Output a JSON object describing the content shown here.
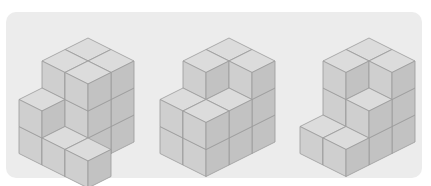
{
  "colors": {
    "background": "#ffffff",
    "panel": "#ececec",
    "top_face": "#dcdcdc",
    "left_face": "#cfcfcf",
    "right_face": "#c2c2c2",
    "edge": "#9a9a9a"
  },
  "projection": {
    "a": 23,
    "b": 11.5,
    "h": 27
  },
  "figures": [
    {
      "name": "figure-1",
      "origin": [
        88,
        38
      ],
      "heights": [
        [
          3,
          3,
          0
        ],
        [
          3,
          3,
          0
        ],
        [
          2,
          1,
          1
        ]
      ]
    },
    {
      "name": "figure-2",
      "origin": [
        229,
        38
      ],
      "heights": [
        [
          3,
          3,
          0
        ],
        [
          3,
          2,
          0
        ],
        [
          2,
          2,
          0
        ]
      ]
    },
    {
      "name": "figure-3",
      "origin": [
        369,
        38
      ],
      "heights": [
        [
          3,
          3,
          0
        ],
        [
          3,
          2,
          0
        ],
        [
          1,
          1,
          0
        ]
      ]
    }
  ]
}
